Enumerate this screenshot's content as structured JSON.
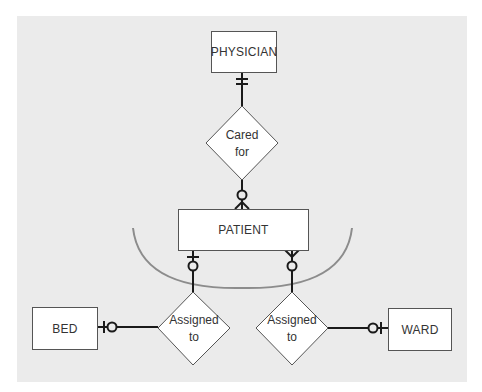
{
  "diagram": {
    "type": "entity-relationship",
    "colors": {
      "background": "#ebebeb",
      "entity_fill": "#ffffff",
      "line": "#1a1a1a",
      "arc": "#8c8c8c"
    },
    "entities": {
      "physician": "PHYSICIAN",
      "patient": "PATIENT",
      "bed": "BED",
      "ward": "WARD"
    },
    "relationships": {
      "cared_for": {
        "line1": "Cared",
        "line2": "for"
      },
      "assigned_bed": {
        "line1": "Assigned",
        "line2": "to"
      },
      "assigned_ward": {
        "line1": "Assigned",
        "line2": "to"
      }
    },
    "connections": [
      {
        "from": "PHYSICIAN",
        "to": "Cared for",
        "end_at_physician": "mandatory-one"
      },
      {
        "from": "Cared for",
        "to": "PATIENT",
        "end_at_patient": "optional-many"
      },
      {
        "from": "PATIENT",
        "to": "Assigned to (bed)",
        "end_at_patient": "optional-one"
      },
      {
        "from": "PATIENT",
        "to": "Assigned to (ward)",
        "end_at_patient": "optional-many"
      },
      {
        "from": "Assigned to (bed)",
        "to": "BED",
        "end_at_bed": "optional-one"
      },
      {
        "from": "Assigned to (ward)",
        "to": "WARD",
        "end_at_ward": "optional-one"
      }
    ]
  }
}
